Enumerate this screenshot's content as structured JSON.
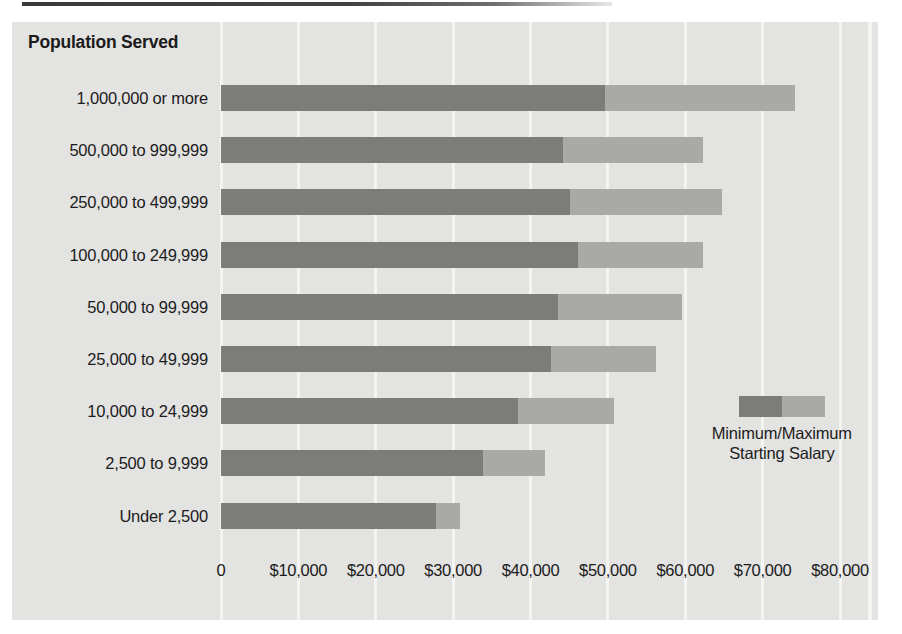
{
  "chart_data": {
    "type": "bar",
    "orientation": "horizontal",
    "subtype": "floating-range-bar",
    "title": "",
    "axis_title": "Population Served",
    "xlabel": "",
    "ylabel": "Population Served",
    "xlim": [
      0,
      80000
    ],
    "grid": true,
    "grid_axis": "x",
    "legend": {
      "position": "inside-right",
      "line_1": "Minimum/Maximum",
      "line_2": "Starting Salary",
      "entries": [
        {
          "name": "Minimum Starting Salary",
          "color": "#7c7c7a"
        },
        {
          "name": "Maximum Starting Salary",
          "color": "#a9a9a7"
        }
      ]
    },
    "xticks": [
      0,
      10000,
      20000,
      30000,
      40000,
      50000,
      60000,
      70000,
      80000
    ],
    "xtick_labels": [
      "0",
      "$10,000",
      "$20,000",
      "$30,000",
      "$40,000",
      "$50,000",
      "$60,000",
      "$70,000",
      "$80,000"
    ],
    "categories": [
      "1,000,000 or more",
      "500,000 to 999,999",
      "250,000 to 499,999",
      "100,000 to 249,999",
      "50,000 to 99,999",
      "25,000 to 49,999",
      "10,000 to 24,999",
      "2,500 to 9,999",
      "Under 2,500"
    ],
    "series": [
      {
        "name": "Minimum Starting Salary",
        "color": "#7c7c7a",
        "values": [
          49600,
          44200,
          45100,
          46100,
          43600,
          42700,
          38400,
          33900,
          27800
        ]
      },
      {
        "name": "Maximum Starting Salary",
        "color": "#a9a9a7",
        "values": [
          74200,
          62300,
          64800,
          62300,
          59600,
          56200,
          50800,
          41900,
          30900
        ]
      }
    ]
  },
  "style": {
    "panel_bg": "#e3e3e1",
    "gridline_color": "#f4f4f2",
    "page_bg": "#ffffff",
    "text_color": "#1c1c1c"
  }
}
